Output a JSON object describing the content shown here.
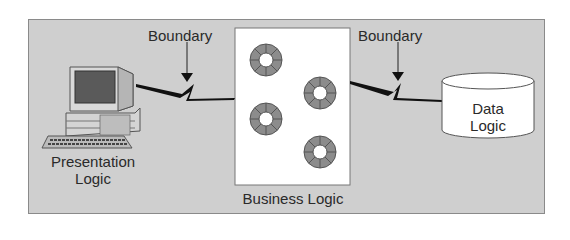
{
  "diagram": {
    "type": "three-tier architecture",
    "boundaries": [
      {
        "label": "Boundary"
      },
      {
        "label": "Boundary"
      }
    ],
    "nodes": [
      {
        "id": "presentation",
        "label_line1": "Presentation",
        "label_line2": "Logic",
        "icon": "desktop-computer-icon"
      },
      {
        "id": "business",
        "label": "Business Logic",
        "component_count": 4,
        "icon": "component-ring-icon"
      },
      {
        "id": "data",
        "label_line1": "Data",
        "label_line2": "Logic",
        "icon": "database-cylinder-icon"
      }
    ],
    "edges": [
      {
        "from": "presentation",
        "to": "business",
        "style": "lightning"
      },
      {
        "from": "business",
        "to": "data",
        "style": "lightning"
      }
    ]
  },
  "colors": {
    "background": "#cfcfcf",
    "box": "#ffffff",
    "ring": "#8c8c8c",
    "line": "#111111"
  }
}
